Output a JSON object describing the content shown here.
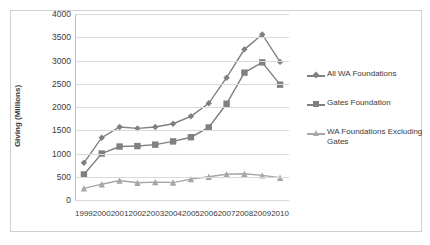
{
  "chart_data": {
    "type": "line",
    "title": "",
    "xlabel": "",
    "ylabel": "Giving (Millions)",
    "categories": [
      "1999",
      "2000",
      "2001",
      "2002",
      "2003",
      "2004",
      "2005",
      "2006",
      "2007",
      "2008",
      "2009",
      "2010"
    ],
    "ylim": [
      0,
      4000
    ],
    "yticks": [
      "0",
      "500",
      "1000",
      "1500",
      "2000",
      "2500",
      "3000",
      "3500",
      "4000"
    ],
    "grid": true,
    "legend_position": "right",
    "series": [
      {
        "name": "All WA Foundations",
        "color": "#808080",
        "marker": "diamond",
        "values": [
          800,
          1340,
          1570,
          1540,
          1570,
          1640,
          1800,
          2080,
          2630,
          3240,
          3560,
          2970
        ]
      },
      {
        "name": "Gates Foundation",
        "color": "#808080",
        "marker": "square",
        "values": [
          550,
          1000,
          1150,
          1160,
          1190,
          1260,
          1350,
          1560,
          2070,
          2740,
          2960,
          2480
        ]
      },
      {
        "name": "WA Foundations Excluding Gates",
        "color": "#a6a6a6",
        "marker": "triangle",
        "values": [
          250,
          340,
          420,
          370,
          385,
          375,
          450,
          500,
          555,
          565,
          530,
          480
        ]
      }
    ]
  }
}
